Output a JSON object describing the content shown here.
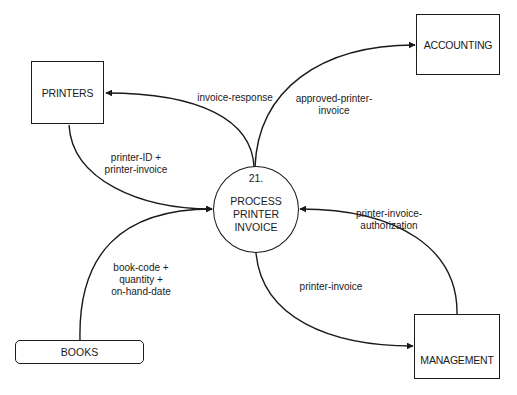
{
  "diagram": {
    "type": "data-flow-diagram",
    "process": {
      "id": "21.",
      "name": "PROCESS\nPRINTER\nINVOICE"
    },
    "entities": {
      "printers": "PRINTERS",
      "accounting": "ACCOUNTING",
      "management": "MANAGEMENT"
    },
    "stores": {
      "books": "BOOKS"
    },
    "flows": {
      "invoice_response": {
        "label": "invoice-response",
        "from": "21.",
        "to": "PRINTERS"
      },
      "approved_printer_invoice": {
        "label": "approved-printer-\ninvoice",
        "from": "21.",
        "to": "ACCOUNTING"
      },
      "printer_id_invoice": {
        "label": "printer-ID +\nprinter-invoice",
        "from": "PRINTERS",
        "to": "21."
      },
      "book_code": {
        "label": "book-code +\nquantity +\non-hand-date",
        "from": "BOOKS",
        "to": "21."
      },
      "printer_invoice": {
        "label": "printer-invoice",
        "from": "21.",
        "to": "MANAGEMENT"
      },
      "authorization": {
        "label": "printer-invoice-\nauthorization",
        "from": "MANAGEMENT",
        "to": "21."
      }
    },
    "colors": {
      "line": "#1a1a1a",
      "background": "#ffffff"
    }
  }
}
